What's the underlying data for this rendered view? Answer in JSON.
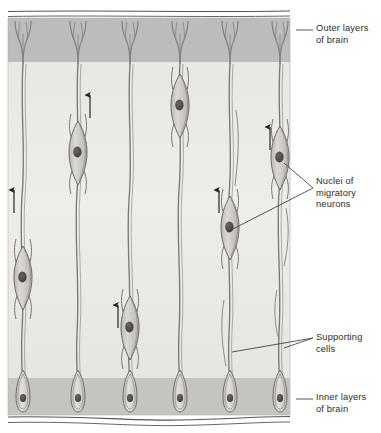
{
  "figure": {
    "type": "biological-diagram",
    "orientation": "vertical tissue slab, migration direction upward"
  },
  "labels": {
    "outer_layers": "Outer layers\nof brain",
    "nuclei_migratory": "Nuclei of\nmigratory\nneurons",
    "supporting_cells": "Supporting\ncells",
    "inner_layers": "Inner layers\nof brain"
  },
  "regions": [
    {
      "name": "outer-layers-band",
      "y_top": 18,
      "y_bottom": 62,
      "fill": "#bcbcbc"
    },
    {
      "name": "middle-zone",
      "y_top": 62,
      "y_bottom": 378,
      "fill": "#eceae7"
    },
    {
      "name": "inner-layers-band",
      "y_top": 378,
      "y_bottom": 415,
      "fill": "#c6c4c1"
    }
  ],
  "colors": {
    "slab_outer": "#bcbcbc",
    "slab_middle": "#eceae7",
    "slab_inner": "#c6c4c1",
    "cell_fill": "#d9d6d2",
    "cell_stroke": "#6e6b68",
    "nucleus_fill": "#4a4744",
    "soma_fill": "#ddd9d5",
    "text": "#2b2b2b",
    "leader": "#3a3a3a",
    "arrow": "#1f1f1f",
    "rule": "#555555"
  },
  "columns": [
    {
      "id": 1,
      "x": 23,
      "soma_y": 400,
      "neuron_y": 280,
      "arrow": {
        "x": 14,
        "y_tail": 213,
        "y_head": 188
      }
    },
    {
      "id": 2,
      "x": 78,
      "soma_y": 400,
      "neuron_y": 155,
      "arrow": {
        "x": 90,
        "y_tail": 118,
        "y_head": 93
      }
    },
    {
      "id": 3,
      "x": 130,
      "soma_y": 400,
      "neuron_y": 330,
      "arrow": {
        "x": 118,
        "y_tail": 328,
        "y_head": 303
      }
    },
    {
      "id": 4,
      "x": 180,
      "soma_y": 400,
      "neuron_y": 108,
      "arrow": null
    },
    {
      "id": 5,
      "x": 230,
      "soma_y": 400,
      "neuron_y": 230,
      "arrow": {
        "x": 219,
        "y_tail": 213,
        "y_head": 188
      }
    },
    {
      "id": 6,
      "x": 280,
      "soma_y": 400,
      "neuron_y": 160,
      "arrow": {
        "x": 270,
        "y_tail": 150,
        "y_head": 125
      }
    }
  ],
  "counts": {
    "supporting_cells": 6,
    "migratory_neurons": 6,
    "direction_arrows": 5
  },
  "leaders": {
    "outer": {
      "x1": 296,
      "y1": 30,
      "x2": 313,
      "y2": 30
    },
    "inner": {
      "x1": 296,
      "y1": 399,
      "x2": 313,
      "y2": 399
    },
    "nuclei_branch_a": {
      "x1": 284,
      "y1": 163,
      "x2": 313,
      "y2": 188
    },
    "nuclei_branch_b": {
      "x1": 226,
      "y1": 232,
      "x2": 313,
      "y2": 188
    },
    "support_branch_a": {
      "x1": 232,
      "y1": 352,
      "x2": 313,
      "y2": 338
    },
    "support_branch_b": {
      "x1": 284,
      "y1": 348,
      "x2": 313,
      "y2": 338
    }
  }
}
